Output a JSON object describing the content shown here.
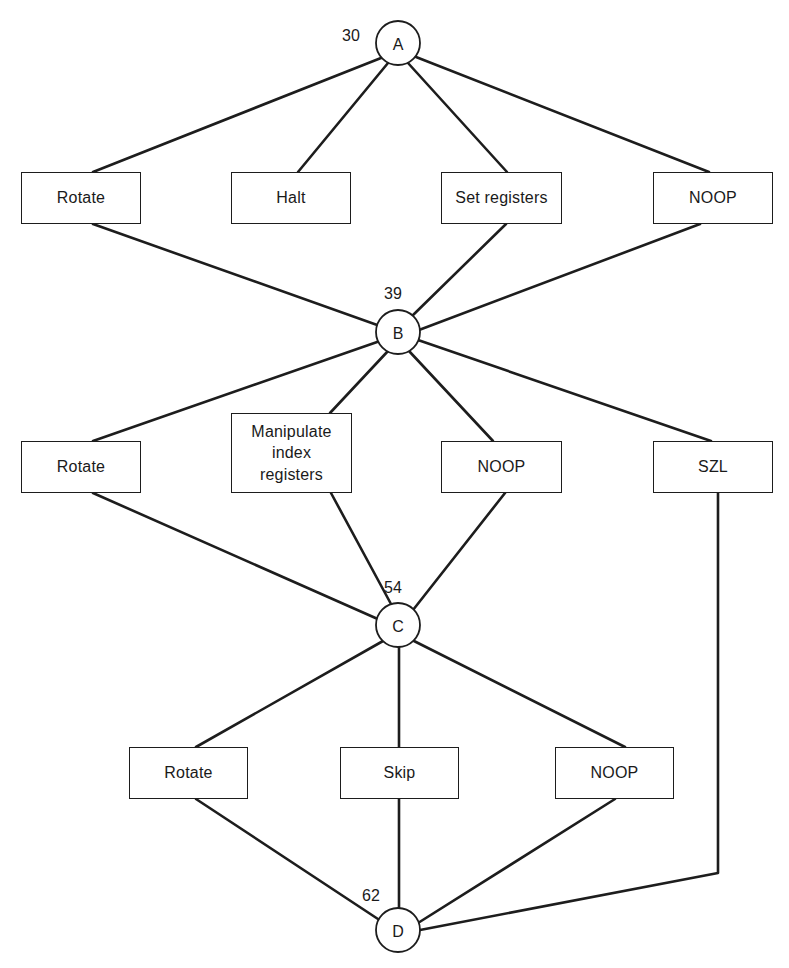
{
  "diagram": {
    "type": "decision-tree",
    "title": "",
    "nodes": [
      {
        "id": "A",
        "letter": "A",
        "weight": "30",
        "cx": 398,
        "cy": 43,
        "r": 22,
        "weight_x": 351,
        "weight_y": 35
      },
      {
        "id": "B",
        "letter": "B",
        "weight": "39",
        "cx": 398,
        "cy": 332,
        "r": 22,
        "weight_x": 393,
        "weight_y": 293
      },
      {
        "id": "C",
        "letter": "C",
        "weight": "54",
        "cx": 398,
        "cy": 625,
        "r": 22,
        "weight_x": 393,
        "weight_y": 587
      },
      {
        "id": "D",
        "letter": "D",
        "weight": "62",
        "cx": 398,
        "cy": 930,
        "r": 22,
        "weight_x": 371,
        "weight_y": 895
      }
    ],
    "boxes": [
      {
        "id": "rotate-1",
        "label": "Rotate",
        "x": 21,
        "y": 172,
        "w": 120,
        "h": 52,
        "row": 1
      },
      {
        "id": "halt-1",
        "label": "Halt",
        "x": 231,
        "y": 172,
        "w": 120,
        "h": 52,
        "row": 1
      },
      {
        "id": "set-registers-1",
        "label": "Set registers",
        "x": 441,
        "y": 172,
        "w": 121,
        "h": 52,
        "row": 1
      },
      {
        "id": "noop-1",
        "label": "NOOP",
        "x": 653,
        "y": 172,
        "w": 120,
        "h": 52,
        "row": 1
      },
      {
        "id": "rotate-2",
        "label": "Rotate",
        "x": 21,
        "y": 441,
        "w": 120,
        "h": 52,
        "row": 2
      },
      {
        "id": "manipulate-index-registers-2",
        "label": "Manipulate\nindex\nregisters",
        "x": 231,
        "y": 413,
        "w": 121,
        "h": 80,
        "row": 2
      },
      {
        "id": "noop-2",
        "label": "NOOP",
        "x": 441,
        "y": 441,
        "w": 121,
        "h": 52,
        "row": 2
      },
      {
        "id": "szl-2",
        "label": "SZL",
        "x": 653,
        "y": 441,
        "w": 120,
        "h": 52,
        "row": 2
      },
      {
        "id": "rotate-3",
        "label": "Rotate",
        "x": 129,
        "y": 747,
        "w": 119,
        "h": 52,
        "row": 3
      },
      {
        "id": "skip-3",
        "label": "Skip",
        "x": 340,
        "y": 747,
        "w": 119,
        "h": 52,
        "row": 3
      },
      {
        "id": "noop-3",
        "label": "NOOP",
        "x": 555,
        "y": 747,
        "w": 119,
        "h": 52,
        "row": 3
      }
    ],
    "edges": [
      {
        "id": "a-to-rotate-1",
        "from": "A",
        "to": "rotate-1",
        "points": "381,58 93,172"
      },
      {
        "id": "a-to-halt-1",
        "from": "A",
        "to": "halt-1",
        "points": "388,63 298,172"
      },
      {
        "id": "a-to-set-registers-1",
        "from": "A",
        "to": "set-registers-1",
        "points": "408,63 507,172"
      },
      {
        "id": "a-to-noop-1",
        "from": "A",
        "to": "noop-1",
        "points": "416,57 709,172"
      },
      {
        "id": "rotate-1-to-b",
        "from": "rotate-1",
        "to": "B",
        "points": "93,224 380,326"
      },
      {
        "id": "set-registers-1-to-b",
        "from": "set-registers-1",
        "to": "B",
        "points": "506,224 410,318"
      },
      {
        "id": "noop-1-to-b",
        "from": "noop-1",
        "to": "B",
        "points": "700,224 419,330"
      },
      {
        "id": "b-to-rotate-2",
        "from": "B",
        "to": "rotate-2",
        "points": "380,341 93,441"
      },
      {
        "id": "b-to-manipulate-2",
        "from": "B",
        "to": "manipulate-index-registers-2",
        "points": "388,351 330,413"
      },
      {
        "id": "b-to-noop-2",
        "from": "B",
        "to": "noop-2",
        "points": "409,351 493,441"
      },
      {
        "id": "b-to-szl-2",
        "from": "B",
        "to": "szl-2",
        "points": "418,340 711,441"
      },
      {
        "id": "rotate-2-to-c",
        "from": "rotate-2",
        "to": "C",
        "points": "93,493 380,620"
      },
      {
        "id": "manipulate-2-to-c",
        "from": "manipulate-index-registers-2",
        "to": "C",
        "points": "331,493 391,604"
      },
      {
        "id": "noop-2-to-c",
        "from": "noop-2",
        "to": "C",
        "points": "505,493 413,610"
      },
      {
        "id": "c-to-rotate-3",
        "from": "C",
        "to": "rotate-3",
        "points": "383,641 196,747"
      },
      {
        "id": "c-to-skip-3",
        "from": "C",
        "to": "skip-3",
        "points": "399,647 399,747"
      },
      {
        "id": "c-to-noop-3",
        "from": "C",
        "to": "noop-3",
        "points": "414,641 625,747"
      },
      {
        "id": "rotate-3-to-d",
        "from": "rotate-3",
        "to": "D",
        "points": "196,799 381,921"
      },
      {
        "id": "skip-3-to-d",
        "from": "skip-3",
        "to": "D",
        "points": "399,799 399,908"
      },
      {
        "id": "noop-3-to-d",
        "from": "noop-3",
        "to": "D",
        "points": "615,799 418,923"
      },
      {
        "id": "szl-2-to-d",
        "from": "szl-2",
        "to": "D",
        "points": "718,493 718,873 420,930"
      }
    ],
    "colors": {
      "stroke": "#1d1d1d",
      "background": "#ffffff",
      "text": "#1a1a1a"
    }
  }
}
